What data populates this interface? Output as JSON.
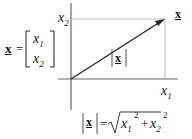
{
  "diagram": {
    "type": "vector-in-2d-plane",
    "vector_symbol": "x",
    "axes": {
      "horizontal_label": "x",
      "horizontal_subscript": "1",
      "vertical_label": "x",
      "vertical_subscript": "2"
    },
    "column_vector": {
      "lhs": "x",
      "equals": "=",
      "entries": [
        {
          "symbol": "x",
          "subscript": "1"
        },
        {
          "symbol": "x",
          "subscript": "2"
        }
      ]
    },
    "tip_label": "x",
    "magnitude_label": "x",
    "norm_formula": {
      "lhs": "x",
      "equals": "=",
      "radicand_terms": [
        {
          "symbol": "x",
          "subscript": "1",
          "power": "2"
        },
        {
          "op": "+"
        },
        {
          "symbol": "x",
          "subscript": "2",
          "power": "2"
        }
      ],
      "plus": "+"
    },
    "colors": {
      "axis": "#555555",
      "arrow": "#222222",
      "projection": "#bbbbbb",
      "text": "#111111"
    }
  }
}
